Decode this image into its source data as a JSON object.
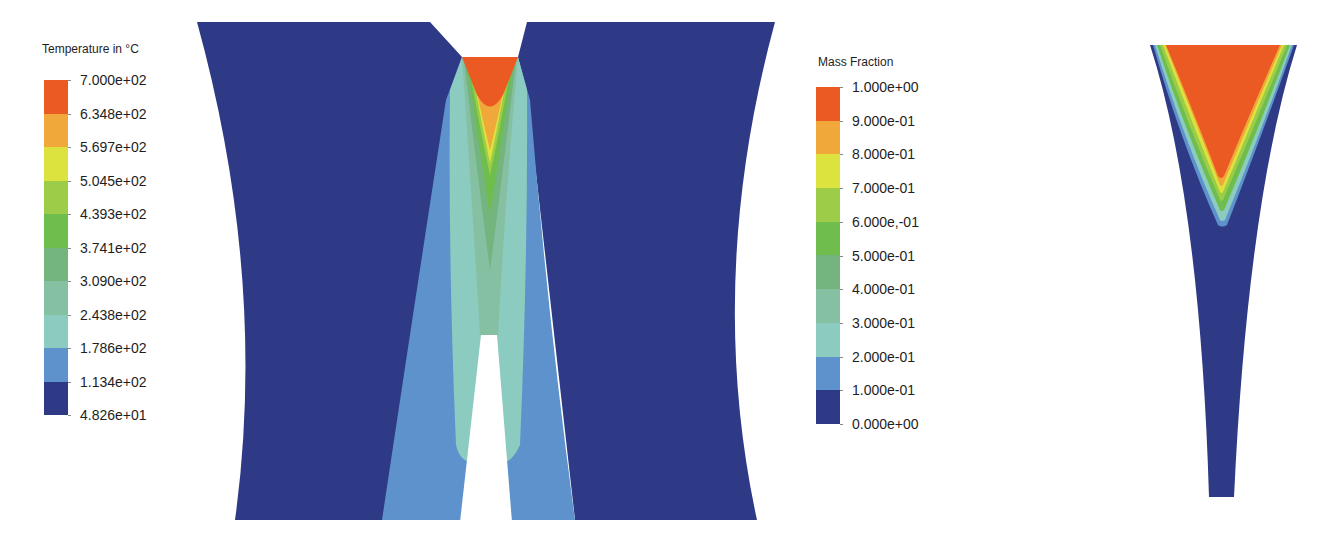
{
  "colors": {
    "c0": "#2e3a86",
    "c1": "#5d8fc8",
    "c2": "#8cc9b3",
    "c3": "#7ab88a",
    "c4": "#6bbb55",
    "c5": "#8cc846",
    "c6": "#d7e03a",
    "c7": "#f0a83a",
    "c8": "#ea5a22"
  },
  "temperature_legend": {
    "title": "Temperature in °C",
    "labels": [
      "7.000e+02",
      "6.348e+02",
      "5.697e+02",
      "5.045e+02",
      "4.393e+02",
      "3.741e+02",
      "3.090e+02",
      "2.438e+02",
      "1.786e+02",
      "1.134e+02",
      "4.826e+01"
    ],
    "swatches": [
      "#ea5a22",
      "#f0a83a",
      "#dde33e",
      "#9ccc48",
      "#6fbe4d",
      "#74b57f",
      "#86c0a2",
      "#8ccbbf",
      "#5e92cc",
      "#2e3a86"
    ]
  },
  "mass_fraction_legend": {
    "title": "Mass Fraction",
    "labels": [
      "1.000e+00",
      "9.000e-01",
      "8.000e-01",
      "7.000e-01",
      "6.000e,-01",
      "5.000e-01",
      "4.000e-01",
      "3.000e-01",
      "2.000e-01",
      "1.000e-01",
      "0.000e+00"
    ],
    "swatches": [
      "#ea5a22",
      "#f0a83a",
      "#dde33e",
      "#9ccc48",
      "#6fbe4d",
      "#74b57f",
      "#86c0a2",
      "#8ccbbf",
      "#5e92cc",
      "#2e3a86"
    ]
  },
  "plots": {
    "temperature_plot": "Temperature contour: two workpiece blocks with V-notch weld zone",
    "mass_fraction_plot": "Mass fraction contour: tapered weld bead"
  }
}
